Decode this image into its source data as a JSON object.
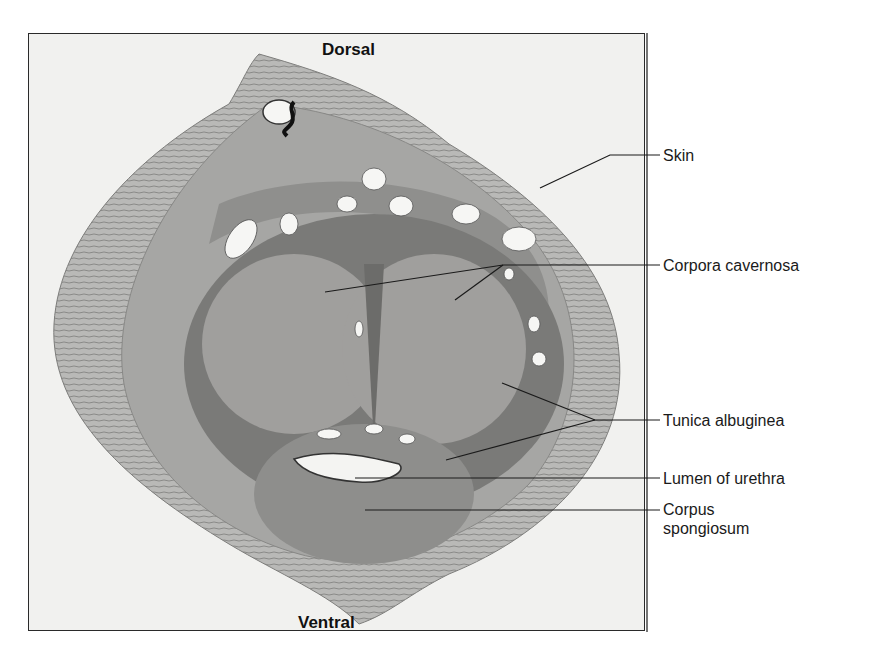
{
  "figure": {
    "orientation": {
      "top": "Dorsal",
      "bottom": "Ventral"
    },
    "labels": [
      {
        "id": "skin",
        "text": "Skin"
      },
      {
        "id": "corpora-cavernosa",
        "text": "Corpora cavernosa"
      },
      {
        "id": "tunica-albuginea",
        "text": "Tunica albuginea"
      },
      {
        "id": "lumen-of-urethra",
        "text": "Lumen of urethra"
      },
      {
        "id": "corpus-spongiosum",
        "text": "Corpus\nspongiosum"
      }
    ],
    "label_lines": {
      "corpus_spongiosum_line1": "Corpus",
      "corpus_spongiosum_line2": "spongiosum"
    },
    "colors": {
      "background": "#ffffff",
      "slide": "#f1f1ef",
      "tissue_dark": "#6e6e6e",
      "tissue_mid": "#9a9a9a",
      "tissue_light": "#c8c8c6",
      "leader_line": "#1a1a1a"
    }
  }
}
